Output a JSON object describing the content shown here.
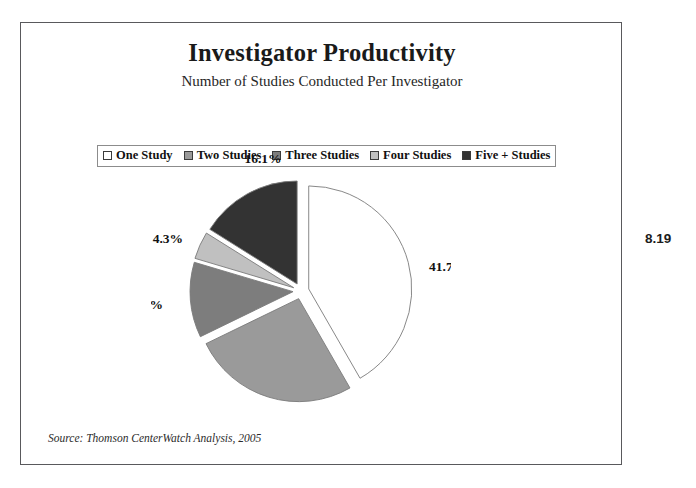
{
  "figure": {
    "number": "8.19"
  },
  "header": {
    "title": "Investigator Productivity",
    "subtitle": "Number of Studies Conducted Per Investigator"
  },
  "legend": {
    "items": [
      {
        "label": "One Study",
        "color": "#ffffff"
      },
      {
        "label": "Two Studies",
        "color": "#9a9a9a"
      },
      {
        "label": "Three Studies",
        "color": "#7d7d7d"
      },
      {
        "label": "Four Studies",
        "color": "#c0c0c0"
      },
      {
        "label": "Five + Studies",
        "color": "#333333"
      }
    ]
  },
  "footer": {
    "source": "Source: Thomson CenterWatch Analysis, 2005"
  },
  "chart_data": {
    "type": "pie",
    "title": "Investigator Productivity",
    "subtitle": "Number of Studies Conducted Per Investigator",
    "legend_position": "top",
    "exploded": true,
    "start_angle_deg": 0,
    "direction": "clockwise",
    "categories": [
      "One Study",
      "Two Studies",
      "Three Studies",
      "Four Studies",
      "Five + Studies"
    ],
    "values": [
      41.7,
      26.1,
      11.8,
      4.3,
      16.1
    ],
    "unit": "%",
    "labels": [
      "41.7%",
      "26.1%",
      "11.8%",
      "4.3%",
      "16.1%"
    ],
    "colors": [
      "#ffffff",
      "#9a9a9a",
      "#7d7d7d",
      "#c0c0c0",
      "#333333"
    ],
    "slice_outline_color": "#7a7a7a"
  }
}
